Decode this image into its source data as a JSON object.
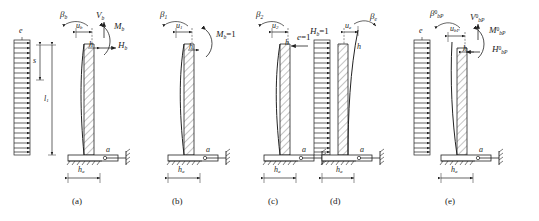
{
  "figure": {
    "ink_color": "#222222",
    "hatch_color": "#555555"
  },
  "panels": [
    {
      "id": "a",
      "caption": "(a)",
      "load_label": "e",
      "dim_upper": "s",
      "dim_lower": "l",
      "dim_lower_sub": "1",
      "rotation_label": "β",
      "rotation_sub": "b",
      "disp_label": "u",
      "disp_sub": "b",
      "height_label": "h",
      "shear_label": "V",
      "shear_sub": "b",
      "moment_label": "M",
      "moment_sub": "b",
      "thrust_label": "H",
      "thrust_sub": "b",
      "base_point": "a",
      "base_dim": "h",
      "base_dim_sub": "a"
    },
    {
      "id": "b",
      "caption": "(b)",
      "rotation_label": "β",
      "rotation_sub": "1",
      "disp_label": "u",
      "disp_sub": "1",
      "height_label": "h",
      "applied_label": "M",
      "applied_sub": "b",
      "applied_value": "=1",
      "base_point": "a",
      "base_dim": "h",
      "base_dim_sub": "a"
    },
    {
      "id": "c",
      "caption": "(c)",
      "rotation_label": "β",
      "rotation_sub": "2",
      "disp_label": "u",
      "disp_sub": "2",
      "height_label": "h",
      "applied_label": "H",
      "applied_sub": "b",
      "applied_value": "=1",
      "base_point": "a",
      "base_dim": "h",
      "base_dim_sub": "a"
    },
    {
      "id": "d",
      "caption": "(d)",
      "load_label": "e",
      "load_value": "=1",
      "rotation_label": "β",
      "rotation_sub": "e",
      "disp_label": "u",
      "disp_sub": "e",
      "height_label": "h",
      "base_point": "a",
      "base_dim": "h",
      "base_dim_sub": "a"
    },
    {
      "id": "e",
      "caption": "(e)",
      "load_label": "e",
      "rotation_label": "β",
      "rotation_sup": "0",
      "rotation_sub": "bP",
      "disp_label": "u",
      "disp_sub": "bP",
      "height_label": "h",
      "shear_label": "V",
      "shear_sup": "0",
      "shear_sub": "bP",
      "moment_label": "M",
      "moment_sup": "0",
      "moment_sub": "bP",
      "thrust_label": "H",
      "thrust_sup": "0",
      "thrust_sub": "bP",
      "base_point": "a",
      "base_dim": "h",
      "base_dim_sub": "a"
    }
  ]
}
